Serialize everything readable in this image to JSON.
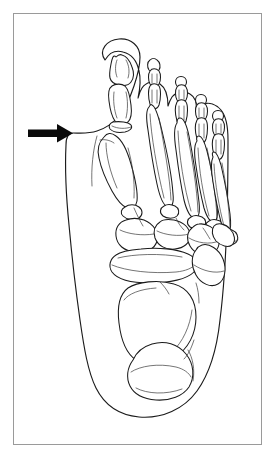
{
  "figure": {
    "caption": "",
    "frame": {
      "border_color": "#9a9a9a",
      "background_color": "#ffffff",
      "x": 13,
      "y": 13,
      "width": 249,
      "height": 432
    },
    "line_color": "#1b1b1b",
    "fill_color": "#ffffff"
  },
  "annotation": {
    "arrow": {
      "name": "medial-prominence-arrow",
      "label": "",
      "color": "#0a0a0a",
      "direction": "right",
      "tail_x": 28,
      "tip_x": 72,
      "y": 133,
      "target": "medial eminence of first metatarsal head (bunion)"
    }
  },
  "anatomy": {
    "view": "dorsal",
    "side": "right foot",
    "soft_tissue_outline": "foot silhouette",
    "structures": [
      {
        "name": "hallux-distal-phalanx",
        "region": "toe-1"
      },
      {
        "name": "hallux-proximal-phalanx",
        "region": "toe-1"
      },
      {
        "name": "first-metatarsal",
        "region": "forefoot"
      },
      {
        "name": "sesamoid",
        "region": "first-mtp-joint"
      },
      {
        "name": "second-toe-phalanges",
        "region": "toe-2"
      },
      {
        "name": "third-toe-phalanges",
        "region": "toe-3"
      },
      {
        "name": "fourth-toe-phalanges",
        "region": "toe-4"
      },
      {
        "name": "fifth-toe-phalanges",
        "region": "toe-5"
      },
      {
        "name": "second-metatarsal",
        "region": "forefoot"
      },
      {
        "name": "third-metatarsal",
        "region": "forefoot"
      },
      {
        "name": "fourth-metatarsal",
        "region": "forefoot"
      },
      {
        "name": "fifth-metatarsal",
        "region": "forefoot"
      },
      {
        "name": "medial-cuneiform",
        "region": "midfoot"
      },
      {
        "name": "intermediate-cuneiform",
        "region": "midfoot"
      },
      {
        "name": "lateral-cuneiform",
        "region": "midfoot"
      },
      {
        "name": "cuboid",
        "region": "midfoot"
      },
      {
        "name": "navicular",
        "region": "midfoot"
      },
      {
        "name": "talus",
        "region": "hindfoot"
      },
      {
        "name": "calcaneus",
        "region": "hindfoot"
      }
    ]
  }
}
